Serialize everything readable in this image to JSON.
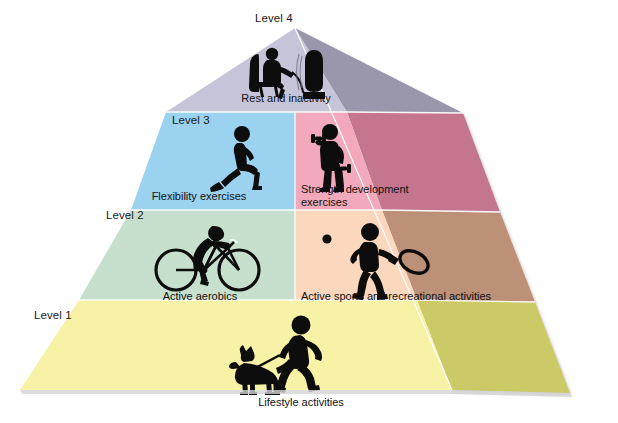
{
  "figure": {
    "type": "physical-activity-pyramid",
    "title": "",
    "background_color": "#ffffff"
  },
  "levels": [
    {
      "id": "level-4",
      "level_label": "Level 4",
      "label_pos": {
        "x": 255,
        "y": 12
      },
      "segments": [
        {
          "id": "rest-and-inactivity",
          "text": "Rest and inactivity",
          "front_color": "#c6c4d8",
          "side_color": "#9a97ad",
          "icon": "person-sitting-watching-tv-icon",
          "text_x": 286,
          "text_y": 92
        }
      ]
    },
    {
      "id": "level-3",
      "level_label": "Level 3",
      "label_pos": {
        "x": 172,
        "y": 114
      },
      "segments": [
        {
          "id": "flexibility-exercises",
          "text": "Flexibility exercises",
          "front_color": "#9bd2f0",
          "side_color": "#8cb8d4",
          "icon": "person-stretching-lunge-icon",
          "text_x": 199,
          "text_y": 190
        },
        {
          "id": "strength-development-exercises",
          "text": "Strength development\nexercises",
          "front_color": "#f2a9bb",
          "side_color": "#c4768f",
          "icon": "person-lifting-dumbbells-icon",
          "text_x": 301,
          "text_y": 183
        }
      ]
    },
    {
      "id": "level-2",
      "level_label": "Level 2",
      "label_pos": {
        "x": 106,
        "y": 209
      },
      "segments": [
        {
          "id": "active-aerobics",
          "text": "Active aerobics",
          "front_color": "#c7e0cd",
          "side_color": "#a9bfae",
          "icon": "person-cycling-icon",
          "text_x": 200,
          "text_y": 290
        },
        {
          "id": "active-sports-and-recreational-activities",
          "text": "Active sports and recreational activities",
          "front_color": "#fbd7bd",
          "side_color": "#bd9078",
          "icon": "person-playing-tennis-icon",
          "text_x": 396,
          "text_y": 290
        }
      ]
    },
    {
      "id": "level-1",
      "level_label": "Level 1",
      "label_pos": {
        "x": 34,
        "y": 309
      },
      "segments": [
        {
          "id": "lifestyle-activities",
          "text": "Lifestyle activities",
          "front_color": "#f7f2a6",
          "side_color": "#ccca66",
          "icon": "person-walking-dog-icon",
          "text_x": 301,
          "text_y": 396
        }
      ]
    }
  ],
  "geometry": {
    "apex": {
      "x": 295,
      "y": 28
    },
    "front_base_left": {
      "x": 20,
      "y": 390
    },
    "front_base_right": {
      "x": 452,
      "y": 390
    },
    "right_base": {
      "x": 570,
      "y": 393
    },
    "divider_color": "#ffffff",
    "shadow_color": "#d9d9d9"
  }
}
